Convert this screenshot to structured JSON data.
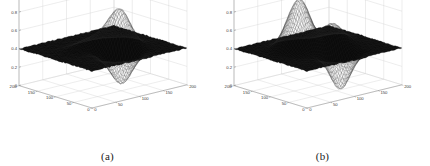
{
  "figure": {
    "background_color": "#ffffff",
    "panels": [
      {
        "id": "a",
        "caption": "(a)",
        "chart_index": 0
      },
      {
        "id": "b",
        "caption": "(b)",
        "chart_index": 1
      }
    ]
  },
  "chart_data": [
    {
      "type": "surface",
      "title": "",
      "caption": "(a)",
      "xlabel": "",
      "ylabel": "",
      "zlabel": "",
      "xlim": [
        0,
        200
      ],
      "ylim": [
        0,
        200
      ],
      "zlim": [
        0,
        1
      ],
      "xticks": [
        0,
        50,
        100,
        150,
        200
      ],
      "yticks": [
        0,
        50,
        100,
        150,
        200
      ],
      "zticks": [
        0,
        0.2,
        0.4,
        0.6,
        0.8,
        1
      ],
      "xtick_labels": [
        "0",
        "50",
        "100",
        "150",
        "200"
      ],
      "ytick_labels": [
        "0",
        "50",
        "100",
        "150",
        "200"
      ],
      "ztick_labels": [
        "0",
        "0.2",
        "0.4",
        "0.6",
        "0.8",
        "1"
      ],
      "grid": true,
      "legend": "none",
      "surface_color": "#0a0a0a",
      "mesh_color": "#262626",
      "baseline_level": 0.4,
      "features": [
        {
          "kind": "peak",
          "cx": 128,
          "cy": 86,
          "amp": 0.36,
          "sx": 17,
          "sy": 17,
          "note": "sharp central ridge peak reaching ~0.76"
        },
        {
          "kind": "peak",
          "cx": 112,
          "cy": 108,
          "amp": 0.16,
          "sx": 22,
          "sy": 18,
          "note": "secondary shoulder"
        },
        {
          "kind": "trough",
          "cx": 102,
          "cy": 52,
          "amp": 0.34,
          "sx": 19,
          "sy": 17,
          "note": "deep front dip toward 0.06"
        },
        {
          "kind": "trough",
          "cx": 86,
          "cy": 96,
          "amp": 0.1,
          "sx": 15,
          "sy": 13,
          "note": "shallow saddle notch"
        },
        {
          "kind": "peak",
          "cx": 74,
          "cy": 120,
          "amp": 0.07,
          "sx": 20,
          "sy": 16,
          "note": "low left bump"
        }
      ],
      "noise_amplitude": 0.012,
      "view": {
        "azimuth": -37.5,
        "elevation": 30
      }
    },
    {
      "type": "surface",
      "title": "",
      "caption": "(b)",
      "xlabel": "",
      "ylabel": "",
      "zlabel": "",
      "xlim": [
        0,
        200
      ],
      "ylim": [
        0,
        200
      ],
      "zlim": [
        0,
        1
      ],
      "xticks": [
        0,
        50,
        100,
        150,
        200
      ],
      "yticks": [
        0,
        50,
        100,
        150,
        200
      ],
      "zticks": [
        0,
        0.2,
        0.4,
        0.6,
        0.8,
        1
      ],
      "xtick_labels": [
        "0",
        "50",
        "100",
        "150",
        "200"
      ],
      "ytick_labels": [
        "0",
        "50",
        "100",
        "150",
        "200"
      ],
      "ztick_labels": [
        "0",
        "0.2",
        "0.4",
        "0.6",
        "0.8",
        "1"
      ],
      "grid": true,
      "legend": "none",
      "surface_color": "#0a0a0a",
      "mesh_color": "#262626",
      "baseline_level": 0.4,
      "features": [
        {
          "kind": "peak",
          "cx": 76,
          "cy": 118,
          "amp": 0.56,
          "sx": 21,
          "sy": 21,
          "note": "tall smooth dome reaching ~0.96"
        },
        {
          "kind": "peak",
          "cx": 126,
          "cy": 96,
          "amp": 0.22,
          "sx": 20,
          "sy": 17,
          "note": "mid-right ridge ~0.62"
        },
        {
          "kind": "trough",
          "cx": 104,
          "cy": 44,
          "amp": 0.38,
          "sx": 18,
          "sy": 16,
          "note": "deep front-right valley near 0.02"
        },
        {
          "kind": "trough",
          "cx": 100,
          "cy": 104,
          "amp": 0.12,
          "sx": 14,
          "sy": 14,
          "note": "saddle between peaks"
        },
        {
          "kind": "peak",
          "cx": 150,
          "cy": 120,
          "amp": 0.06,
          "sx": 22,
          "sy": 18,
          "note": "slight back-right swell"
        }
      ],
      "noise_amplitude": 0.01,
      "view": {
        "azimuth": -37.5,
        "elevation": 30
      }
    }
  ]
}
